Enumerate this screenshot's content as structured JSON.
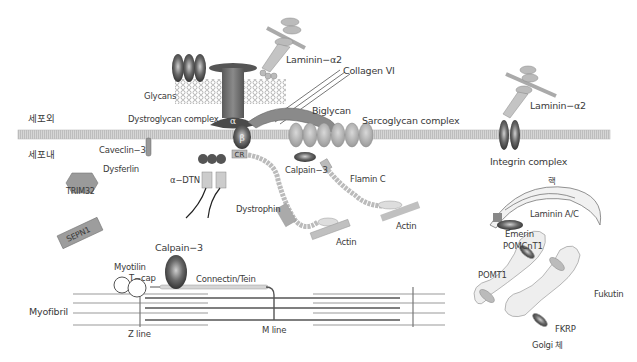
{
  "diagram": {
    "regions": {
      "extracellular": "세포외",
      "intracellular": "세포내"
    },
    "extracellular": {
      "glycans": "Glycans",
      "laminin_a2_top": "Laminin−α2",
      "collagen": "Collagen VI",
      "biglycan": "Biglycan",
      "dystroglycan_complex": "Dystroglycan complex",
      "sarcoglycan_complex": "Sarcoglycan complex",
      "laminin_a2_right": "Laminin−α2",
      "integrin_complex": "Integrin complex"
    },
    "membrane_symbols": {
      "dg_alpha": "α",
      "dg_beta": "β",
      "cr": "CR",
      "sarcoglycans": [
        "ζ",
        "ε",
        "δ",
        "α",
        "β",
        "γ"
      ],
      "integrin_alpha": "α",
      "integrin_beta": "β",
      "syn": "Syn"
    },
    "intracellular": {
      "caveolin": "Caveclin−3",
      "dysferlin": "Dysferlin",
      "trim32": "TRIM32",
      "sepn1": "SEPN1",
      "a_dtn": "α−DTN",
      "calpain3_membrane": "Calpain−3",
      "filamin_c": "Flamin C",
      "dystrophin": "Dystrophin",
      "actin_left": "Actin",
      "actin_right": "Actin"
    },
    "myofibril": {
      "label": "Myofibril",
      "calpain3": "Calpain−3",
      "myotilin": "Myotilin",
      "tcap": "T−cap",
      "connectin": "Connectin/Tein",
      "z_line": "Z line",
      "m_line": "M line"
    },
    "nucleus_golgi": {
      "nucleus": "핵",
      "laminin_ac": "Laminin A/C",
      "emerin": "Emerin",
      "pomgnt1": "POMCnT1",
      "pomt1": "POMT1",
      "fukutin": "Fukutin",
      "fkrp": "FKRP",
      "golgi": "Golgi 체"
    },
    "colors": {
      "membrane": "#c9c9c9",
      "protein_dark": "#6b6b6b",
      "protein_mid": "#a5a5a5",
      "protein_light": "#d8d8d8",
      "text": "#3a3a3a"
    }
  }
}
